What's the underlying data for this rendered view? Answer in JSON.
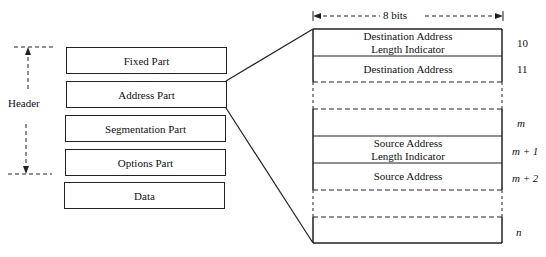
{
  "title": "",
  "header_label": "Header",
  "left_parts": [
    {
      "label": "Fixed Part"
    },
    {
      "label": "Address Part"
    },
    {
      "label": "Segmentation Part"
    },
    {
      "label": "Options Part"
    },
    {
      "label": "Data"
    }
  ],
  "width_label": "8 bits",
  "address_fields": [
    {
      "label": "Destination Address\nLength Indicator",
      "octet": "10"
    },
    {
      "label": "Destination Address",
      "octet": "11"
    },
    {
      "label": "",
      "octet": ""
    },
    {
      "label": "",
      "octet": "m"
    },
    {
      "label": "Source Address\nLength Indicator",
      "octet": "m + 1"
    },
    {
      "label": "Source Address",
      "octet": "m + 2"
    },
    {
      "label": "",
      "octet": ""
    },
    {
      "label": "",
      "octet": "n"
    }
  ]
}
